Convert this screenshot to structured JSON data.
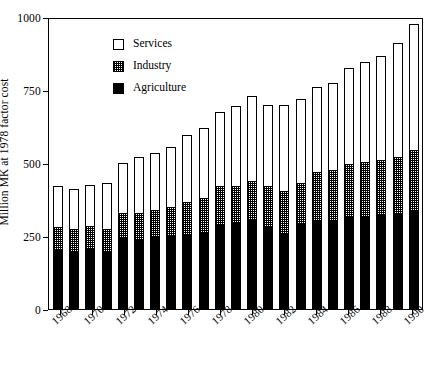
{
  "chart_data": {
    "type": "bar",
    "subtype": "stacked-vertical",
    "title": "",
    "xlabel": "",
    "ylabel": "Million MK at 1978 factor cost",
    "ylim": [
      0,
      1000
    ],
    "yticks": [
      0,
      250,
      500,
      750,
      1000
    ],
    "ytick_labels": [
      "0",
      "250",
      "500",
      "750",
      "1000"
    ],
    "grid": false,
    "legend_position": "top-left-inside",
    "categories": [
      "1968",
      "1969",
      "1970",
      "1971",
      "1972",
      "1973",
      "1974",
      "1975",
      "1976",
      "1977",
      "1978",
      "1979",
      "1980",
      "1981",
      "1982",
      "1983",
      "1984",
      "1985",
      "1986",
      "1987",
      "1988",
      "1989",
      "1990"
    ],
    "xtick_labels": [
      "1968",
      "1970",
      "1972",
      "1974",
      "1976",
      "1978",
      "1980",
      "1982",
      "1984",
      "1986",
      "1988",
      "1990"
    ],
    "series": [
      {
        "name": "Agriculture",
        "color": "#000000",
        "pattern": "solid",
        "values": [
          205,
          200,
          210,
          195,
          245,
          240,
          245,
          250,
          255,
          260,
          290,
          295,
          305,
          280,
          260,
          290,
          300,
          300,
          320,
          320,
          325,
          330,
          340
        ]
      },
      {
        "name": "Industry",
        "color": "#ffffff",
        "pattern": "checkered",
        "values": [
          75,
          75,
          75,
          80,
          85,
          90,
          95,
          100,
          110,
          120,
          130,
          125,
          135,
          140,
          145,
          140,
          170,
          175,
          175,
          185,
          185,
          190,
          205
        ]
      },
      {
        "name": "Services",
        "color": "#ffffff",
        "pattern": "open",
        "values": [
          140,
          135,
          140,
          155,
          170,
          190,
          195,
          205,
          230,
          240,
          255,
          275,
          290,
          280,
          295,
          290,
          290,
          300,
          330,
          340,
          355,
          390,
          430
        ]
      }
    ],
    "totals": [
      420,
      410,
      425,
      430,
      500,
      520,
      535,
      555,
      595,
      620,
      675,
      695,
      730,
      700,
      700,
      720,
      760,
      775,
      825,
      845,
      865,
      910,
      975
    ]
  },
  "legend": {
    "items": [
      {
        "label": "Services",
        "swatch": "open-square-icon"
      },
      {
        "label": "Industry",
        "swatch": "checkered-square-icon"
      },
      {
        "label": "Agriculture",
        "swatch": "filled-square-icon"
      }
    ]
  }
}
